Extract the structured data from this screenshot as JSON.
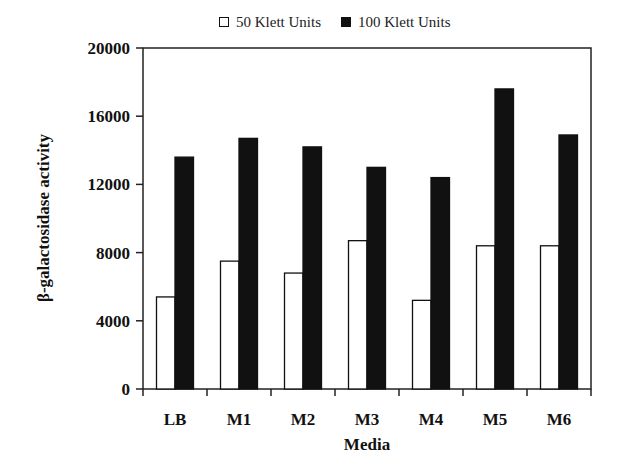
{
  "chart_data": {
    "type": "bar",
    "title": "",
    "xlabel": "Media",
    "ylabel": "β-galactosidase activity",
    "categories": [
      "LB",
      "M1",
      "M2",
      "M3",
      "M4",
      "M5",
      "M6"
    ],
    "series": [
      {
        "name": "50 Klett Units",
        "color": "#ffffff",
        "values": [
          5400,
          7500,
          6800,
          8700,
          5200,
          8400,
          8400
        ]
      },
      {
        "name": "100 Klett Units",
        "color": "#111111",
        "values": [
          13600,
          14700,
          14200,
          13000,
          12400,
          17600,
          14900
        ]
      }
    ],
    "ylim": [
      0,
      20000
    ],
    "yticks": [
      0,
      4000,
      8000,
      12000,
      16000,
      20000
    ],
    "grid": false,
    "legend_position": "top"
  },
  "legend": {
    "items": [
      {
        "label": "50 Klett Units",
        "swatch": "white"
      },
      {
        "label": "100 Klett Units",
        "swatch": "black"
      }
    ]
  }
}
